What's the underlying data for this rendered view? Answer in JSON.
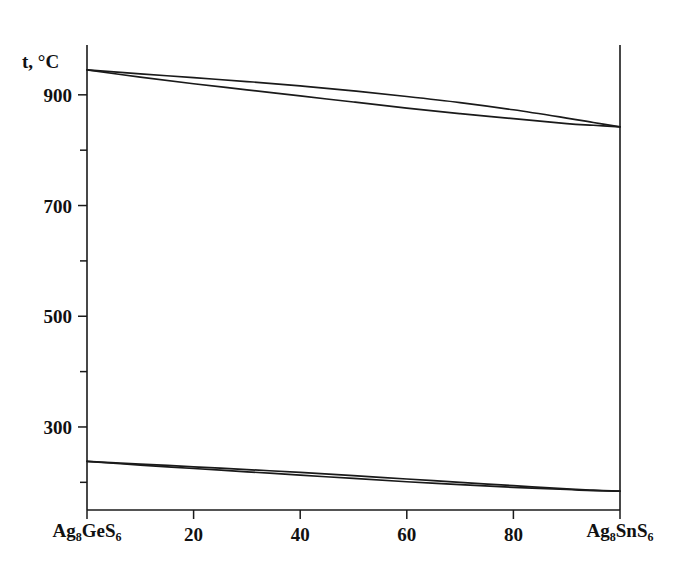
{
  "chart_data": {
    "type": "line",
    "title": "",
    "subtitle": "",
    "xlabel": "",
    "ylabel": "t, °C",
    "y_axis_title": "t, °C",
    "xlim": [
      0,
      100
    ],
    "ylim": [
      150,
      990
    ],
    "grid": false,
    "legend": "none",
    "x_ticks": [
      0,
      20,
      40,
      60,
      80,
      100
    ],
    "x_tick_labels": [
      "Ag8GeS6",
      "20",
      "40",
      "60",
      "80",
      "Ag8SnS6"
    ],
    "x_end_left": {
      "formula": "Ag",
      "sub1": "8",
      "mid": "GeS",
      "sub2": "6"
    },
    "x_end_right": {
      "formula": "Ag",
      "sub1": "8",
      "mid": "SnS",
      "sub2": "6"
    },
    "y_ticks": [
      200,
      300,
      400,
      500,
      600,
      700,
      800,
      900
    ],
    "y_tick_labels": [
      "",
      "300",
      "",
      "500",
      "",
      "700",
      "",
      "900"
    ],
    "y_major_labels": [
      "900",
      "700",
      "500",
      "300"
    ],
    "series": [
      {
        "name": "liquidus",
        "x": [
          0,
          10,
          20,
          30,
          40,
          50,
          60,
          70,
          80,
          90,
          95,
          100
        ],
        "values": [
          945,
          938,
          931,
          924,
          916,
          907,
          897,
          886,
          873,
          858,
          850,
          842
        ]
      },
      {
        "name": "solidus",
        "x": [
          0,
          10,
          20,
          30,
          40,
          50,
          60,
          70,
          80,
          90,
          95,
          100
        ],
        "values": [
          945,
          932,
          920,
          909,
          898,
          887,
          876,
          866,
          857,
          848,
          845,
          842
        ]
      },
      {
        "name": "transition-upper",
        "x": [
          0,
          10,
          20,
          30,
          40,
          50,
          60,
          70,
          80,
          90,
          95,
          100
        ],
        "values": [
          238,
          233,
          228,
          223,
          218,
          212,
          206,
          200,
          194,
          188,
          186,
          184
        ]
      },
      {
        "name": "transition-lower",
        "x": [
          0,
          10,
          20,
          30,
          40,
          50,
          60,
          70,
          80,
          90,
          95,
          100
        ],
        "values": [
          238,
          231,
          225,
          219,
          213,
          207,
          201,
          196,
          191,
          187,
          185,
          184
        ]
      }
    ]
  }
}
